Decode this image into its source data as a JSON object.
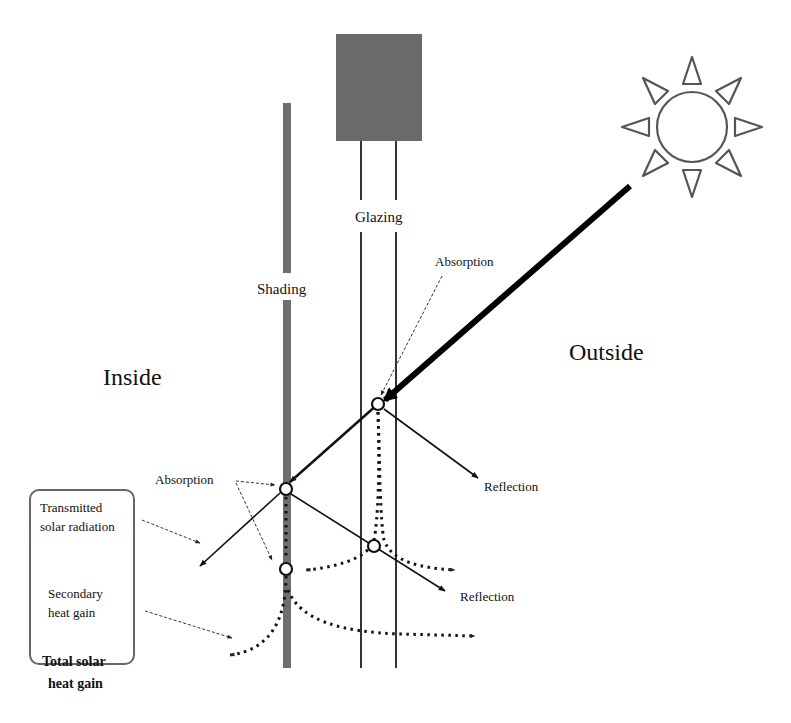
{
  "diagram": {
    "title": "",
    "regions": {
      "inside": "Inside",
      "outside": "Outside"
    },
    "components": {
      "shading": "Shading",
      "glazing": "Glazing"
    },
    "annotations": {
      "absorption_glazing": "Absorption",
      "absorption_shading": "Absorption",
      "reflection_glazing": "Reflection",
      "reflection_shading": "Reflection"
    },
    "legend_box": {
      "transmitted_line1": "Transmitted",
      "transmitted_line2": "solar radiation",
      "secondary_line1": "Secondary",
      "secondary_line2": "heat gain"
    },
    "total": {
      "line1": "Total solar",
      "line2": "heat gain"
    },
    "colors": {
      "shading_bar": "#6e6e6e",
      "glazing_frame": "#6a6a6a",
      "line": "#111111",
      "sun_stroke": "#555555"
    },
    "icons": [
      "sun-icon"
    ]
  }
}
